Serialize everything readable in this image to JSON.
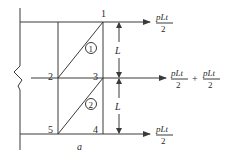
{
  "diagram": {
    "type": "truss-panel-load-diagram",
    "nodes": [
      {
        "id": "1",
        "label": "1"
      },
      {
        "id": "2",
        "label": "2"
      },
      {
        "id": "3",
        "label": "3"
      },
      {
        "id": "4",
        "label": "4"
      },
      {
        "id": "5",
        "label": "5"
      }
    ],
    "panels": [
      {
        "id": "panel-1",
        "label": "1"
      },
      {
        "id": "panel-2",
        "label": "2"
      }
    ],
    "loads": {
      "top": {
        "numerator": "pLt",
        "denominator": "2"
      },
      "middle": {
        "term1": {
          "numerator": "pLt",
          "denominator": "2"
        },
        "operator": "+",
        "term2": {
          "numerator": "pLt",
          "denominator": "2"
        }
      },
      "bottom": {
        "numerator": "pLt",
        "denominator": "2"
      }
    },
    "dimensions": {
      "upper_height": "L",
      "lower_height": "L",
      "width": "a"
    },
    "colors": {
      "line": "#3a3a3a",
      "background": "#ffffff"
    }
  }
}
